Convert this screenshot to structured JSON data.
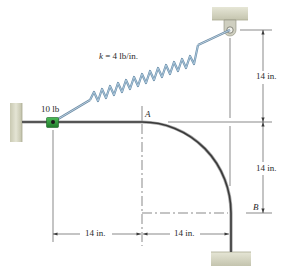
{
  "figure": {
    "type": "mechanics-diagram"
  },
  "labels": {
    "spring_constant_var": "k",
    "spring_constant_rest": " = 4 lb/in.",
    "collar_weight": "10 lb",
    "point_a": "A",
    "point_b": "B",
    "dim_vertical_upper": "14 in.",
    "dim_vertical_lower": "14 in.",
    "dim_horizontal_left": "14 in.",
    "dim_horizontal_right": "14 in."
  },
  "colors": {
    "ground": "#d8d8c4",
    "ground_edge": "#b8b8a2",
    "rod": "#3a3a3a",
    "rod_highlight": "#9a9a9a",
    "spring": "#8fb0c8",
    "spring_dark": "#6a8aa4",
    "collar": "#2e9a3c",
    "collar_dark": "#1d6b27",
    "dimension": "#3a3a3a",
    "bracket": "#c8c8b8"
  }
}
